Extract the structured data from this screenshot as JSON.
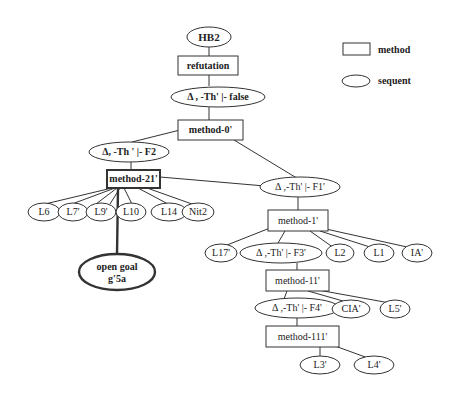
{
  "legend": {
    "method_label": "method",
    "sequent_label": "sequent"
  },
  "nodes": {
    "hb2": "HB2",
    "refutation": "refutation",
    "seq_false": "Δ , -Th' |- false",
    "method_0": "method-0'",
    "seq_f2": "Δ, -Th ' |- F2",
    "method_21": "method-21'",
    "seq_f1": "Δ ,-Th' |- F1'",
    "l6": "L6",
    "l7": "L7'",
    "l9": "L9'",
    "l10": "L10",
    "l14": "L14",
    "nit2": "Nit2",
    "open_goal_line1": "open goal",
    "open_goal_line2": "g'5a",
    "method_1": "method-1'",
    "l17": "L17'",
    "seq_f3": "Δ ,-Th' |- F3'",
    "l2": "L2",
    "l1": "L1",
    "ia": "IA'",
    "method_11": "method-11'",
    "seq_f4": "Δ ,-Th' |- F4'",
    "cia": "CIA'",
    "l5": "L5'",
    "method_111": "method-111'",
    "l3": "L3'",
    "l4": "L4'"
  }
}
